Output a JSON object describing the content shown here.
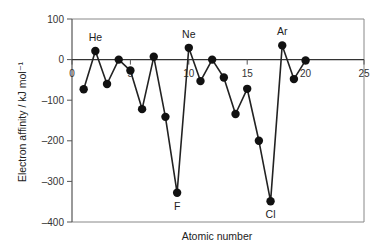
{
  "chart_data": {
    "type": "line",
    "title": "",
    "xlabel": "Atomic number",
    "ylabel": "Electron affinity / kJ mol⁻¹",
    "xlim": [
      0,
      25
    ],
    "ylim": [
      -400,
      100
    ],
    "xticks": [
      0,
      5,
      10,
      15,
      20,
      25
    ],
    "yticks": [
      100,
      0,
      -100,
      -200,
      -300,
      -400
    ],
    "x": [
      1,
      2,
      3,
      4,
      5,
      6,
      7,
      8,
      9,
      10,
      11,
      12,
      13,
      14,
      15,
      16,
      17,
      18,
      19,
      20
    ],
    "series": [
      {
        "name": "Electron affinity",
        "values": [
          -73,
          21,
          -60,
          0,
          -27,
          -122,
          7,
          -141,
          -328,
          29,
          -53,
          0,
          -44,
          -134,
          -72,
          -200,
          -349,
          35,
          -48,
          -2
        ]
      }
    ],
    "annotations": [
      {
        "text": "He",
        "x": 2,
        "y": 21,
        "position": "above"
      },
      {
        "text": "Ne",
        "x": 10,
        "y": 29,
        "position": "above"
      },
      {
        "text": "Ar",
        "x": 18,
        "y": 35,
        "position": "above"
      },
      {
        "text": "F",
        "x": 9,
        "y": -328,
        "position": "below"
      },
      {
        "text": "Cl",
        "x": 17,
        "y": -349,
        "position": "below"
      }
    ],
    "grid": false,
    "legend": "none",
    "zero_line": true
  },
  "colors": {
    "line": "#222222",
    "marker": "#111111",
    "axis": "#555555",
    "frame": "#888888"
  }
}
